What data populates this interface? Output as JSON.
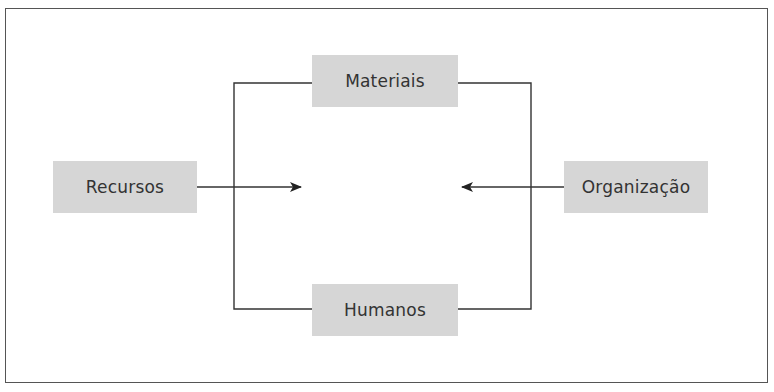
{
  "diagram": {
    "nodes": {
      "materiais": {
        "label": "Materiais"
      },
      "humanos": {
        "label": "Humanos"
      },
      "recursos": {
        "label": "Recursos"
      },
      "organizacao": {
        "label": "Organização"
      }
    },
    "edges": [
      {
        "from": "recursos",
        "to": "center",
        "type": "arrow"
      },
      {
        "from": "organizacao",
        "to": "center",
        "type": "arrow"
      },
      {
        "from": "materiais",
        "to": "humanos",
        "type": "bracket-connector"
      }
    ],
    "colors": {
      "box_fill": "#d6d6d6",
      "line": "#333333",
      "frame": "#555555",
      "text": "#333333"
    }
  }
}
